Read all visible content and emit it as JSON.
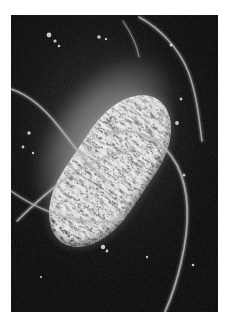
{
  "image": {
    "kind": "electron-micrograph",
    "caption": "",
    "alt_text": "Electron micrograph of a rod-shaped bacterium with peritrichous flagella",
    "frame": {
      "border_color": "#ffffff",
      "border_left": 11,
      "border_top": 15,
      "plate_width": 207,
      "plate_height": 297
    },
    "palette": {
      "background": "#050505",
      "field_mid": "#1d1d1d",
      "halo": "#6f6f6f",
      "cell_body": "#a2a2a2",
      "cell_highlight": "#d9d9d9",
      "flagellum": "#b4b4b4",
      "debris": "#e6e6e6"
    },
    "subject": {
      "name": "bacterium",
      "shape": "rod",
      "rotation_deg": 34,
      "center_x": 99,
      "center_y": 156,
      "length_px": 172,
      "width_px": 78,
      "surface": "wrinkled-ridged"
    },
    "flagella": [
      {
        "id": "flagellum-upper-right",
        "path": "M 128 2 C 150 14 168 34 177 56 C 186 80 188 104 191 126"
      },
      {
        "id": "flagellum-right-sweep",
        "path": "M 96 118 C 128 112 152 124 166 150 C 180 178 178 214 170 248 C 164 274 158 288 154 297"
      },
      {
        "id": "flagellum-left-upper",
        "path": "M 0 74 C 18 80 34 94 48 112 C 64 132 78 152 96 166"
      },
      {
        "id": "flagellum-left-cross",
        "path": "M 6 206 C 24 188 44 170 66 156 C 86 144 104 138 120 136"
      },
      {
        "id": "flagellum-left-lower",
        "path": "M 0 176 C 20 190 42 200 64 204 C 84 208 100 208 112 204"
      },
      {
        "id": "flagellum-top-stub",
        "path": "M 112 6 C 120 18 126 30 128 42"
      }
    ],
    "debris": [
      {
        "x": 38,
        "y": 20,
        "r": 2.4
      },
      {
        "x": 44,
        "y": 26,
        "r": 1.6
      },
      {
        "x": 48,
        "y": 31,
        "r": 1.3
      },
      {
        "x": 88,
        "y": 22,
        "r": 1.8
      },
      {
        "x": 95,
        "y": 24,
        "r": 1.2
      },
      {
        "x": 160,
        "y": 30,
        "r": 1.5
      },
      {
        "x": 170,
        "y": 84,
        "r": 1.4
      },
      {
        "x": 166,
        "y": 108,
        "r": 1.9
      },
      {
        "x": 173,
        "y": 160,
        "r": 1.5
      },
      {
        "x": 18,
        "y": 118,
        "r": 1.7
      },
      {
        "x": 12,
        "y": 132,
        "r": 1.4
      },
      {
        "x": 22,
        "y": 138,
        "r": 1.2
      },
      {
        "x": 56,
        "y": 176,
        "r": 1.5
      },
      {
        "x": 46,
        "y": 214,
        "r": 1.6
      },
      {
        "x": 80,
        "y": 186,
        "r": 1.3
      },
      {
        "x": 92,
        "y": 232,
        "r": 2.2
      },
      {
        "x": 96,
        "y": 236,
        "r": 1.4
      },
      {
        "x": 136,
        "y": 242,
        "r": 1.2
      },
      {
        "x": 182,
        "y": 250,
        "r": 1.3
      },
      {
        "x": 30,
        "y": 262,
        "r": 1.1
      }
    ]
  }
}
